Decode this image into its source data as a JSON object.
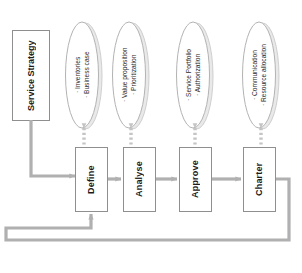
{
  "diagram": {
    "colors": {
      "box_border": "#9a9a9a",
      "box_fill": "#ffffff",
      "ellipse_stroke": "#b3b3b3",
      "ellipse_shadow": "#c9c9c9",
      "arrow": "#b0b0b0",
      "connector_dotted": "#c4c4c4",
      "text": "#1a1a1a"
    },
    "source_box": {
      "label_line1": "Service",
      "label_line2": "Strategy"
    },
    "inputs": [
      {
        "id": "input-1",
        "bullet1": "· Inventories",
        "bullet2": "· Business case"
      },
      {
        "id": "input-2",
        "bullet1": "· Value proposition",
        "bullet2": "· Prioritization"
      },
      {
        "id": "input-3",
        "bullet1": "· Service Portfolio",
        "bullet2": "· Authorization"
      },
      {
        "id": "input-4",
        "bullet1": "· Communication",
        "bullet2": "· Resource allocation"
      }
    ],
    "stages": [
      {
        "id": "stage-define",
        "label": "Define"
      },
      {
        "id": "stage-analyse",
        "label": "Analyse"
      },
      {
        "id": "stage-approve",
        "label": "Approve"
      },
      {
        "id": "stage-charter",
        "label": "Charter"
      }
    ]
  }
}
